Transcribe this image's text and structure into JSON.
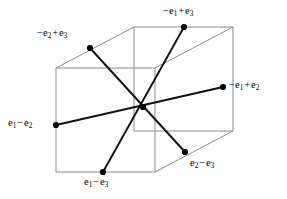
{
  "figure": {
    "kind": "line-diagram",
    "width": 287,
    "height": 199,
    "background_color": "#ffffff",
    "cube": {
      "edge_color": "#8c8c8c",
      "edge_width": 1,
      "front_face": [
        [
          56,
          68
        ],
        [
          155,
          68
        ],
        [
          155,
          172
        ],
        [
          56,
          172
        ]
      ],
      "back_face": [
        [
          134,
          27
        ],
        [
          233,
          27
        ],
        [
          233,
          131
        ],
        [
          134,
          131
        ]
      ],
      "depth_offset": [
        78,
        -41
      ]
    },
    "root_lines": {
      "color": "#111111",
      "width": 1.9,
      "center": [
        143,
        107
      ],
      "pairs": [
        {
          "name": "e1-minus-e2-axis",
          "from": [
            56,
            125
          ],
          "to": [
            223,
            87
          ]
        },
        {
          "name": "e1-minus-e3-axis",
          "from": [
            103,
            172
          ],
          "to": [
            184,
            27
          ]
        },
        {
          "name": "e2-minus-e3-axis",
          "from": [
            90,
            48
          ],
          "to": [
            185,
            152
          ]
        }
      ]
    },
    "dot": {
      "color": "#000000",
      "radius": 3.1
    },
    "vertices": [
      {
        "id": "minus-e1-plus-e3",
        "point": [
          184,
          27
        ],
        "label_text": "−e1 + e3",
        "parts": {
          "sign": "−",
          "base1": "e",
          "sub1": "1",
          "op": "+",
          "base2": "e",
          "sub2": "3"
        },
        "label_pos": [
          163,
          6
        ]
      },
      {
        "id": "minus-e2-plus-e3",
        "point": [
          90,
          48
        ],
        "label_text": "−e2 + e3",
        "parts": {
          "sign": "−",
          "base1": "e",
          "sub1": "2",
          "op": "+",
          "base2": "e",
          "sub2": "3"
        },
        "label_pos": [
          37,
          28
        ]
      },
      {
        "id": "minus-e1-plus-e2",
        "point": [
          223,
          87
        ],
        "label_text": "−e1 + e2",
        "parts": {
          "sign": "−",
          "base1": "e",
          "sub1": "1",
          "op": "+",
          "base2": "e",
          "sub2": "2"
        },
        "label_pos": [
          229,
          80
        ]
      },
      {
        "id": "e1-minus-e2",
        "point": [
          56,
          125
        ],
        "label_text": "e1 − e2",
        "parts": {
          "sign": "",
          "base1": "e",
          "sub1": "1",
          "op": "−",
          "base2": "e",
          "sub2": "2"
        },
        "label_pos": [
          8,
          118
        ]
      },
      {
        "id": "e1-minus-e3",
        "point": [
          103,
          172
        ],
        "label_text": "e1 − e3",
        "parts": {
          "sign": "",
          "base1": "e",
          "sub1": "1",
          "op": "−",
          "base2": "e",
          "sub2": "3"
        },
        "label_pos": [
          84,
          177
        ]
      },
      {
        "id": "e2-minus-e3",
        "point": [
          185,
          152
        ],
        "label_text": "e2 − e3",
        "parts": {
          "sign": "",
          "base1": "e",
          "sub1": "2",
          "op": "−",
          "base2": "e",
          "sub2": "3"
        },
        "label_pos": [
          190,
          158
        ]
      }
    ]
  }
}
